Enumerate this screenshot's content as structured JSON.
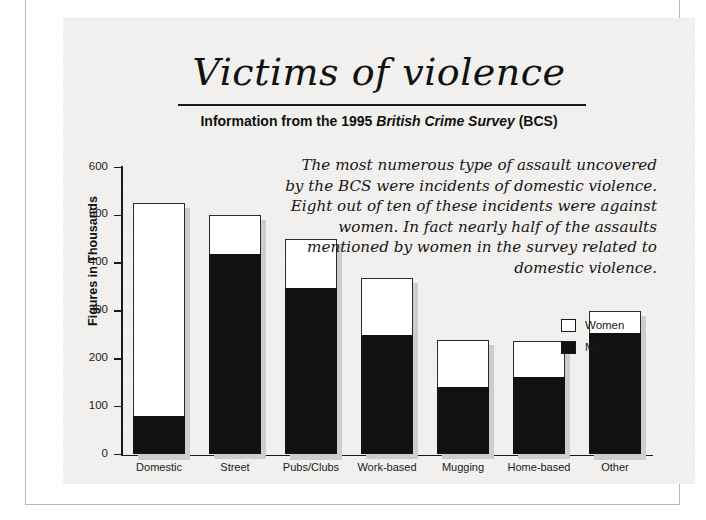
{
  "header": {
    "title": "Victims of violence",
    "subtitle_prefix": "Information from the 1995 ",
    "subtitle_italic": "British Crime Survey",
    "subtitle_suffix": " (BCS)"
  },
  "blurb": {
    "text": "The most numerous type of assault uncovered by the BCS were incidents of domestic violence. Eight out of ten of these incidents were against women. In fact nearly half of the assaults mentioned by women in the survey related to domestic violence."
  },
  "legend": {
    "position": "inside-right",
    "items": [
      {
        "label": "Women",
        "color": "#ffffff"
      },
      {
        "label": "Men",
        "color": "#111111"
      }
    ]
  },
  "chart_data": {
    "type": "bar",
    "subtype": "stacked-vertical",
    "title": "Victims of violence",
    "subtitle": "Information from the 1995 British Crime Survey (BCS)",
    "xlabel": "",
    "ylabel": "Figures in Thousands",
    "ylim": [
      0,
      600
    ],
    "yticks": [
      0,
      100,
      200,
      300,
      400,
      500,
      600
    ],
    "ytick_labels": [
      "0",
      "100",
      "200",
      "300",
      "400",
      "500",
      "600"
    ],
    "grid": false,
    "categories": [
      "Domestic",
      "Street",
      "Pubs/Clubs",
      "Work-based",
      "Mugging",
      "Home-based",
      "Other"
    ],
    "series": [
      {
        "name": "Men",
        "color": "#111111",
        "values": [
          80,
          420,
          348,
          250,
          142,
          162,
          253
        ]
      },
      {
        "name": "Women",
        "color": "#ffffff",
        "values": [
          445,
          80,
          102,
          120,
          98,
          75,
          47
        ]
      }
    ],
    "totals": [
      525,
      500,
      450,
      370,
      240,
      237,
      300
    ],
    "units": "thousands"
  }
}
